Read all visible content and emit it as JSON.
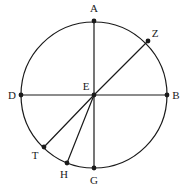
{
  "figure": {
    "background_color": "#ffffff",
    "stroke_color": "#1a1a1a",
    "label_color": "#1a1a1a",
    "circle": {
      "cx": 94,
      "cy": 95,
      "r": 73,
      "stroke_width": 1.2
    },
    "points": [
      {
        "id": "A",
        "label": "A",
        "x": 94,
        "y": 21,
        "label_x": 94,
        "label_y": 8,
        "marker": true
      },
      {
        "id": "Z",
        "label": "Z",
        "x": 148,
        "y": 41,
        "label_x": 155,
        "label_y": 33,
        "marker": true
      },
      {
        "id": "B",
        "label": "B",
        "x": 167,
        "y": 95,
        "label_x": 176,
        "label_y": 95,
        "marker": true
      },
      {
        "id": "D",
        "label": "D",
        "x": 21,
        "y": 95,
        "label_x": 12,
        "label_y": 95,
        "marker": true
      },
      {
        "id": "E",
        "label": "E",
        "x": 94,
        "y": 95,
        "label_x": 86,
        "label_y": 86,
        "marker": true
      },
      {
        "id": "T",
        "label": "T",
        "x": 44,
        "y": 147,
        "label_x": 35,
        "label_y": 155,
        "marker": true
      },
      {
        "id": "H",
        "label": "H",
        "x": 67,
        "y": 163,
        "label_x": 64,
        "label_y": 174,
        "marker": true
      },
      {
        "id": "G",
        "label": "G",
        "x": 94,
        "y": 168,
        "label_x": 94,
        "label_y": 180,
        "marker": true
      }
    ],
    "segments": [
      {
        "name": "diameter-a-g",
        "from": "A",
        "to": "G"
      },
      {
        "name": "diameter-d-b",
        "from": "D",
        "to": "B"
      },
      {
        "name": "radius-e-z",
        "from": "E",
        "to": "Z"
      },
      {
        "name": "radius-e-t",
        "from": "E",
        "to": "T"
      },
      {
        "name": "radius-e-h",
        "from": "E",
        "to": "H"
      }
    ],
    "marker_radius": 2.4
  }
}
